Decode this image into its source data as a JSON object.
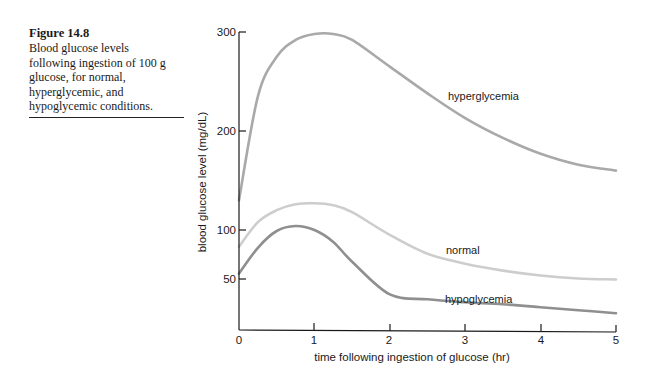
{
  "caption": {
    "figure": "Figure 14.8",
    "lines": [
      "Blood glucose levels",
      "following ingestion of 100 g",
      "glucose, for normal,",
      "hyperglycemic, and",
      "hypoglycemic conditions."
    ]
  },
  "chart": {
    "ylabel": "blood glucose level (mg/dL)",
    "xlabel": "time following ingestion of glucose (hr)",
    "yticks": [
      "300",
      "200",
      "100",
      "50"
    ],
    "xticks": [
      "0",
      "1",
      "2",
      "3",
      "4",
      "5"
    ],
    "labels": {
      "hyperglycemia": "hyperglycemia",
      "normal": "normal",
      "hypoglycemia": "hypoglycemia"
    }
  },
  "colors": {
    "hyperglycemia": "#a9a9a9",
    "normal": "#cdcdcd",
    "hypoglycemia": "#8f8f8f",
    "axis": "#1a1a1a"
  },
  "chart_data": {
    "type": "line",
    "title": "Figure 14.8",
    "subtitle": "Blood glucose levels following ingestion of 100 g glucose, for normal, hyperglycemic, and hypoglycemic conditions.",
    "xlabel": "time following ingestion of glucose (hr)",
    "ylabel": "blood glucose level (mg/dL)",
    "xlim": [
      0,
      5
    ],
    "ylim": [
      0,
      300
    ],
    "xticks": [
      0,
      1,
      2,
      3,
      4,
      5
    ],
    "yticks": [
      50,
      100,
      200,
      300
    ],
    "grid": false,
    "legend": "inline labels on curves",
    "x": [
      0,
      0.25,
      0.5,
      0.75,
      1,
      1.25,
      1.5,
      2,
      2.5,
      3,
      3.5,
      4,
      4.5,
      5
    ],
    "series": [
      {
        "name": "hyperglycemia",
        "values": [
          130,
          235,
          275,
          292,
          298,
          298,
          292,
          265,
          238,
          213,
          193,
          177,
          166,
          160
        ]
      },
      {
        "name": "normal",
        "values": [
          83,
          108,
          120,
          126,
          127,
          125,
          118,
          95,
          76,
          66,
          59,
          54,
          51,
          50
        ]
      },
      {
        "name": "hypoglycemia",
        "values": [
          56,
          82,
          99,
          104,
          100,
          88,
          68,
          35,
          30,
          27,
          25,
          22,
          19,
          16
        ]
      }
    ]
  }
}
